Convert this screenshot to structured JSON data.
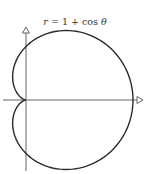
{
  "chart_data": {
    "type": "line",
    "subtype": "polar-curve",
    "title": "r = 1 + cos θ",
    "equation": "r = 1 + cos(theta)",
    "xlabel": "",
    "ylabel": "",
    "grid": false,
    "legend": null,
    "xlim": [
      -0.45,
      2.2
    ],
    "ylim": [
      -1.35,
      1.35
    ],
    "axes": {
      "x_arrow": true,
      "y_arrow": true,
      "arrow_style": "open-triangle"
    },
    "key_points": [
      {
        "theta_deg": 0,
        "r": 2,
        "x": 2,
        "y": 0
      },
      {
        "theta_deg": 60,
        "r": 1.5,
        "x": 0.75,
        "y": 1.299
      },
      {
        "theta_deg": 90,
        "r": 1,
        "x": 0,
        "y": 1
      },
      {
        "theta_deg": 120,
        "r": 0.5,
        "x": -0.25,
        "y": 0.433
      },
      {
        "theta_deg": 180,
        "r": 0,
        "x": 0,
        "y": 0
      },
      {
        "theta_deg": 240,
        "r": 0.5,
        "x": -0.25,
        "y": -0.433
      },
      {
        "theta_deg": 270,
        "r": 1,
        "x": 0,
        "y": -1
      },
      {
        "theta_deg": 300,
        "r": 1.5,
        "x": 0.75,
        "y": -1.299
      }
    ],
    "colors": {
      "curve": "#2a2a2a",
      "axes": "#555555",
      "background": "#ffffff"
    }
  },
  "layout": {
    "origin_px": [
      26,
      100
    ],
    "unit_px": 53.5
  },
  "title_parts": {
    "lhs": "r",
    "eq": " = 1 + cos ",
    "var": "θ"
  }
}
